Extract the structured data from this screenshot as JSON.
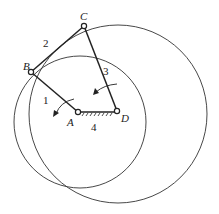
{
  "diagram": {
    "points": {
      "A": {
        "label": "A",
        "x": 78,
        "y": 112
      },
      "B": {
        "label": "B",
        "x": 31,
        "y": 72
      },
      "C": {
        "label": "C",
        "x": 84,
        "y": 26
      },
      "D": {
        "label": "D",
        "x": 117,
        "y": 111
      }
    },
    "links": [
      {
        "id": "1",
        "label": "1",
        "from": "A",
        "to": "B"
      },
      {
        "id": "2",
        "label": "2",
        "from": "B",
        "to": "C"
      },
      {
        "id": "3",
        "label": "3",
        "from": "C",
        "to": "D"
      },
      {
        "id": "4",
        "label": "4",
        "from": "A",
        "to": "D",
        "ground": true
      }
    ],
    "circles": [
      {
        "name": "circle-small",
        "cx": 80,
        "cy": 122,
        "r": 66
      },
      {
        "name": "circle-large",
        "cx": 118,
        "cy": 114,
        "r": 89
      }
    ],
    "colors": {
      "stroke": "#222222",
      "background": "#ffffff"
    }
  }
}
